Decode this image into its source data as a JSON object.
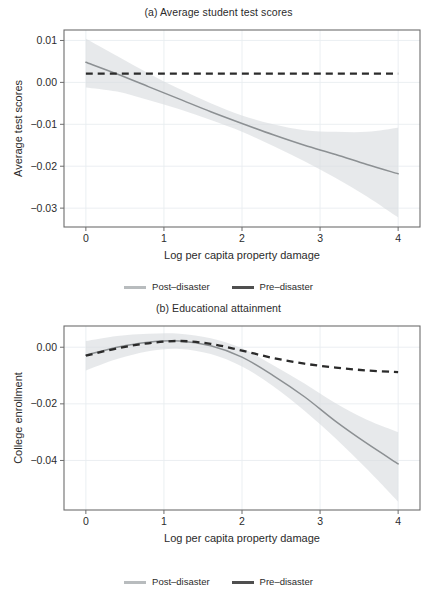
{
  "figure": {
    "panels": [
      {
        "id": "panel-a",
        "title": "(a) Average student test scores",
        "legend": [
          {
            "label": "Post–disaster",
            "style": "post",
            "color": "#b8bcbe"
          },
          {
            "label": "Pre–disaster",
            "style": "pre",
            "color": "#4f4f4f"
          }
        ]
      },
      {
        "id": "panel-b",
        "title": "(b) Educational attainment",
        "legend": [
          {
            "label": "Post–disaster",
            "style": "post",
            "color": "#b8bcbe"
          },
          {
            "label": "Pre–disaster",
            "style": "pre",
            "color": "#4f4f4f"
          }
        ]
      }
    ]
  },
  "chart_data": [
    {
      "type": "line",
      "id": "panel-a",
      "title": "(a) Average student test scores",
      "xlabel": "Log per capita property damage",
      "ylabel": "Average test scores",
      "xlim": [
        -0.28,
        4.28
      ],
      "ylim": [
        -0.0345,
        0.0125
      ],
      "xticks": [
        0,
        1,
        2,
        3,
        4
      ],
      "xticklabels": [
        "0",
        "1",
        "2",
        "3",
        "4"
      ],
      "yticks": [
        0.01,
        0.0,
        -0.01,
        -0.02,
        -0.03
      ],
      "yticklabels": [
        "0.01",
        "0.00",
        "−0.01",
        "−0.02",
        "−0.03"
      ],
      "grid": true,
      "legend_position": "below",
      "series": [
        {
          "name": "Post–disaster",
          "style": "solid",
          "color": "#8c9093",
          "x": [
            0.0,
            0.4,
            0.8,
            1.2,
            1.6,
            2.0,
            2.4,
            2.8,
            3.2,
            3.6,
            4.0
          ],
          "y": [
            0.0048,
            0.002,
            -0.001,
            -0.004,
            -0.007,
            -0.0098,
            -0.0125,
            -0.015,
            -0.0172,
            -0.0196,
            -0.0218
          ],
          "ci_lower": [
            -0.0012,
            -0.0022,
            -0.0042,
            -0.0064,
            -0.009,
            -0.0118,
            -0.0152,
            -0.0188,
            -0.0228,
            -0.0272,
            -0.0322
          ],
          "ci_upper": [
            0.0104,
            0.0063,
            0.0022,
            -0.0016,
            -0.005,
            -0.0079,
            -0.01,
            -0.0114,
            -0.0118,
            -0.0118,
            -0.0108
          ]
        },
        {
          "name": "Pre–disaster",
          "style": "dashed",
          "color": "#2b2b2b",
          "x": [
            0.0,
            1.0,
            2.0,
            3.0,
            4.0
          ],
          "y": [
            0.0021,
            0.0021,
            0.0021,
            0.0021,
            0.0021
          ]
        }
      ]
    },
    {
      "type": "line",
      "id": "panel-b",
      "title": "(b) Educational attainment",
      "xlabel": "Log per capita property damage",
      "ylabel": "College enrollment",
      "xlim": [
        -0.28,
        4.28
      ],
      "ylim": [
        -0.0575,
        0.0075
      ],
      "xticks": [
        0,
        1,
        2,
        3,
        4
      ],
      "xticklabels": [
        "0",
        "1",
        "2",
        "3",
        "4"
      ],
      "yticks": [
        0.0,
        -0.02,
        -0.04
      ],
      "yticklabels": [
        "0.00",
        "−0.02",
        "−0.04"
      ],
      "grid": true,
      "legend_position": "below",
      "series": [
        {
          "name": "Post–disaster",
          "style": "solid",
          "color": "#8c9093",
          "x": [
            0.0,
            0.4,
            0.8,
            1.2,
            1.6,
            2.0,
            2.4,
            2.8,
            3.2,
            3.6,
            4.0
          ],
          "y": [
            -0.0028,
            0.0,
            0.0018,
            0.0022,
            0.0005,
            -0.0035,
            -0.01,
            -0.0175,
            -0.0262,
            -0.034,
            -0.0412
          ],
          "ci_lower": [
            -0.0082,
            -0.0042,
            -0.0014,
            -0.0006,
            -0.0024,
            -0.0068,
            -0.0138,
            -0.0224,
            -0.0322,
            -0.043,
            -0.0545
          ],
          "ci_upper": [
            0.0022,
            0.004,
            0.0048,
            0.0048,
            0.0032,
            -0.0004,
            -0.0064,
            -0.0128,
            -0.0198,
            -0.0256,
            -0.03
          ]
        },
        {
          "name": "Pre–disaster",
          "style": "dashed",
          "color": "#2b2b2b",
          "x": [
            0.0,
            0.4,
            0.8,
            1.2,
            1.6,
            2.0,
            2.4,
            2.8,
            3.2,
            3.6,
            4.0
          ],
          "y": [
            -0.003,
            -0.0004,
            0.0014,
            0.0022,
            0.0012,
            -0.0012,
            -0.0038,
            -0.0058,
            -0.0072,
            -0.0082,
            -0.0088
          ]
        }
      ]
    }
  ]
}
